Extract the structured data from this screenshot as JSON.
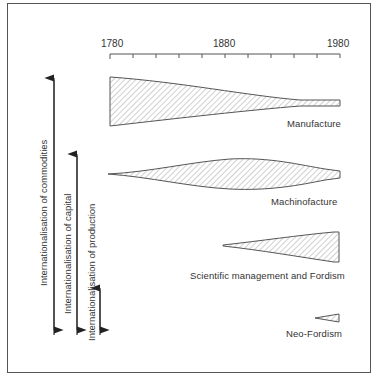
{
  "figure": {
    "axis": {
      "years": [
        "1780",
        "1880",
        "1980"
      ],
      "ticks_count": 11
    },
    "bands": [
      {
        "name": "Manufacture",
        "label": "Manufacture"
      },
      {
        "name": "Machinofacture",
        "label": "Machinofacture"
      },
      {
        "name": "Scientific management and Fordism",
        "label": "Scientific management and Fordism"
      },
      {
        "name": "Neo-Fordism",
        "label": "Neo-Fordism"
      }
    ],
    "arrows": [
      {
        "label": "Internationalisation of commodities"
      },
      {
        "label": "Internationalisation of capital"
      },
      {
        "label": "Internationalisation of production"
      }
    ],
    "colors": {
      "line": "#555555",
      "hatch": "#7a7a7a",
      "background": "#ffffff"
    }
  }
}
